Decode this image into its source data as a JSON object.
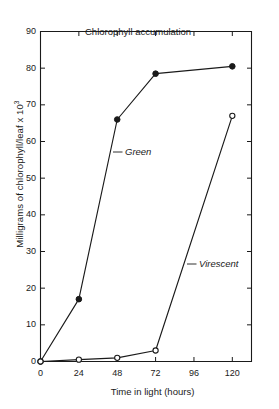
{
  "chart_data": {
    "type": "line",
    "title": "Chlorophyll accumulation",
    "xlabel": "Time in light (hours)",
    "ylabel": "Milligrams of chlorophyll/leaf x 10",
    "ylabel_exponent": "3",
    "x": [
      0,
      24,
      48,
      72,
      120
    ],
    "xlim": [
      0,
      132
    ],
    "ylim": [
      0,
      90
    ],
    "xticks": [
      "0",
      "24",
      "48",
      "72",
      "96",
      "120"
    ],
    "xtick_values": [
      0,
      24,
      48,
      72,
      96,
      120
    ],
    "yticks": [
      "0",
      "10",
      "20",
      "30",
      "40",
      "50",
      "60",
      "70",
      "80",
      "90"
    ],
    "ytick_values": [
      0,
      10,
      20,
      30,
      40,
      50,
      60,
      70,
      80,
      90
    ],
    "grid": false,
    "legend": "inline-labels",
    "series": [
      {
        "name": "Green",
        "marker": "filled-circle",
        "values": [
          0,
          17,
          66,
          78.5,
          80.5
        ]
      },
      {
        "name": "Virescent",
        "marker": "open-circle",
        "values": [
          0,
          0.5,
          1,
          3,
          67
        ]
      }
    ],
    "annotations": [
      {
        "text": "Green",
        "x": 52,
        "y": 52
      },
      {
        "text": "Virescent",
        "x": 95,
        "y": 24
      }
    ],
    "colors": {
      "ink": "#1a1a1a",
      "background": "#ffffff"
    }
  }
}
